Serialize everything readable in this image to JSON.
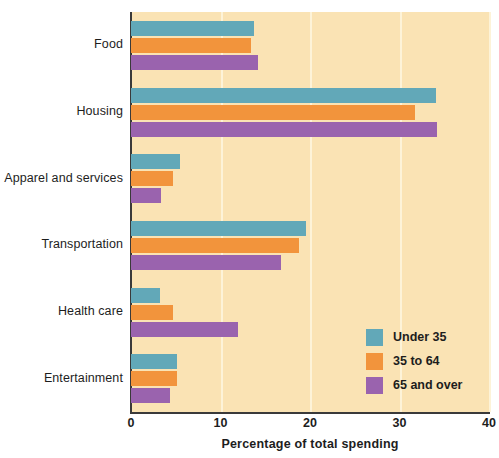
{
  "chart_data": {
    "type": "bar",
    "orientation": "horizontal",
    "title": "",
    "xlabel": "Percentage of total spending",
    "ylabel": "",
    "xlim": [
      0,
      40
    ],
    "xticks": [
      0,
      10,
      20,
      30,
      40
    ],
    "grid": true,
    "legend_position": "inside-bottom-right",
    "categories": [
      "Food",
      "Housing",
      "Apparel and services",
      "Transportation",
      "Health care",
      "Entertainment"
    ],
    "series": [
      {
        "name": "Under 35",
        "color": "#62a8b8",
        "values": [
          13.7,
          34.1,
          5.5,
          19.6,
          3.2,
          5.1
        ]
      },
      {
        "name": "35 to 64",
        "color": "#f2943c",
        "values": [
          13.4,
          31.7,
          4.7,
          18.8,
          4.7,
          5.1
        ]
      },
      {
        "name": "65 and over",
        "color": "#9a63ae",
        "values": [
          14.2,
          34.2,
          3.4,
          16.8,
          12.0,
          4.4
        ]
      }
    ]
  },
  "legend": {
    "items": [
      {
        "label": "Under 35"
      },
      {
        "label": "35 to 64"
      },
      {
        "label": "65 and over"
      }
    ]
  },
  "axis": {
    "x_ticks": [
      "0",
      "10",
      "20",
      "30",
      "40"
    ],
    "x_title": "Percentage of total spending"
  },
  "colors": {
    "plot_background": "#fae3b4",
    "page_background": "#ffffff",
    "axis": "#3a3a3a",
    "gridline": "#fdf3d8",
    "series_under_35": "#62a8b8",
    "series_35_to_64": "#f2943c",
    "series_65_and_over": "#9a63ae"
  }
}
